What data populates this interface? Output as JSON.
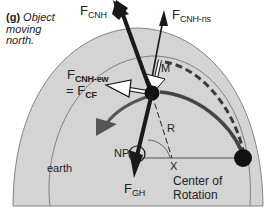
{
  "caption": {
    "tag": "(g)",
    "text_line1": "Object",
    "text_line2": "moving",
    "text_line3": "north."
  },
  "labels": {
    "fcnh": {
      "main": "F",
      "sub": "CNH"
    },
    "fcnh_ns": {
      "main": "F",
      "sub": "CNH-ns"
    },
    "fcnh_ew": {
      "main": "F",
      "sub": "CNH-ew"
    },
    "fcf": {
      "prefix": "= F",
      "sub": "CF"
    },
    "fgh": {
      "main": "F",
      "sub": "GH"
    },
    "m": "M",
    "r": "R",
    "np": "NP",
    "x": "X",
    "earth": "earth",
    "center_line1": "Center of",
    "center_line2": "Rotation"
  },
  "colors": {
    "disk_fill": "#d4d4d4",
    "line": "#4a4a4a",
    "arrow": "#1a1a1a",
    "curve_arrow": "#555555",
    "white_arrow": "#ffffff"
  }
}
